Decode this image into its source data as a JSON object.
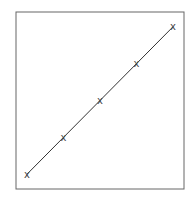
{
  "chart_data": {
    "type": "line",
    "title": "",
    "xlabel": "",
    "ylabel": "",
    "x": [
      1,
      2,
      3,
      4,
      5
    ],
    "series": [
      {
        "name": "",
        "values": [
          1,
          2,
          3,
          4,
          5
        ],
        "marker": "x",
        "color": "#333333"
      }
    ],
    "xlim": [
      0.7,
      5.3
    ],
    "ylim": [
      0.6,
      5.4
    ],
    "grid": false,
    "legend": null,
    "ticks": false
  },
  "colors": {
    "frame": "#666666",
    "line": "#333333",
    "background": "#ffffff"
  }
}
